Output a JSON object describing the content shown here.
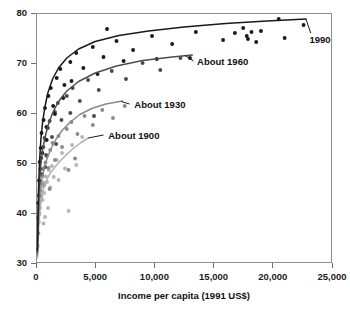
{
  "chart_data": {
    "type": "scatter",
    "title": "",
    "subtitle": "",
    "xlabel": "Income per capita (1991 US$)",
    "ylabel": "",
    "xlim": [
      0,
      25000
    ],
    "ylim": [
      30,
      80
    ],
    "grid": false,
    "legend_position": "inline-curve-labels",
    "xticks": [
      0,
      5000,
      10000,
      15000,
      20000,
      25000
    ],
    "xtick_labels": [
      "0",
      "5,000",
      "10,000",
      "15,000",
      "20,000",
      "25,000"
    ],
    "yticks": [
      30,
      40,
      50,
      60,
      70,
      80
    ],
    "ytick_labels": [
      "30",
      "40",
      "50",
      "60",
      "70",
      "80"
    ],
    "annotations": [
      {
        "text": "1990",
        "x": 23100,
        "y": 74.6,
        "color": "#111111"
      },
      {
        "text": "About 1960",
        "x": 13600,
        "y": 70.2,
        "color": "#111111"
      },
      {
        "text": "About 1930",
        "x": 8300,
        "y": 61.6,
        "color": "#111111"
      },
      {
        "text": "About 1900",
        "x": 6100,
        "y": 55.4,
        "color": "#111111"
      }
    ],
    "series": [
      {
        "name": "About 1900",
        "color": "#b6b6b6",
        "curve_color": "#b2b2b2",
        "curve": [
          [
            120,
            31.0
          ],
          [
            200,
            36.0
          ],
          [
            300,
            39.8
          ],
          [
            420,
            42.4
          ],
          [
            560,
            44.2
          ],
          [
            750,
            45.7
          ],
          [
            980,
            47.0
          ],
          [
            1250,
            48.1
          ],
          [
            1600,
            49.2
          ],
          [
            2000,
            50.3
          ],
          [
            2500,
            51.5
          ],
          [
            3100,
            52.8
          ],
          [
            3800,
            54.1
          ],
          [
            4400,
            55.0
          ]
        ],
        "points": [
          [
            160,
            33.4
          ],
          [
            210,
            35.9
          ],
          [
            250,
            38.2
          ],
          [
            300,
            40.0
          ],
          [
            340,
            41.0
          ],
          [
            380,
            43.2
          ],
          [
            430,
            44.4
          ],
          [
            480,
            45.3
          ],
          [
            560,
            42.6
          ],
          [
            620,
            46.1
          ],
          [
            700,
            44.0
          ],
          [
            820,
            47.3
          ],
          [
            930,
            46.2
          ],
          [
            1080,
            48.6
          ],
          [
            1200,
            45.1
          ],
          [
            1350,
            49.4
          ],
          [
            1500,
            47.2
          ],
          [
            1750,
            50.6
          ],
          [
            1900,
            46.6
          ],
          [
            2200,
            52.0
          ],
          [
            2450,
            48.9
          ],
          [
            2750,
            40.4
          ],
          [
            3050,
            53.6
          ],
          [
            3400,
            49.6
          ],
          [
            3900,
            55.2
          ],
          [
            1020,
            41.0
          ],
          [
            760,
            39.2
          ],
          [
            640,
            37.9
          ]
        ]
      },
      {
        "name": "About 1930",
        "color": "#8c8c8c",
        "curve_color": "#8a8a8a",
        "curve": [
          [
            120,
            31.5
          ],
          [
            200,
            38.0
          ],
          [
            300,
            42.6
          ],
          [
            420,
            45.6
          ],
          [
            560,
            47.6
          ],
          [
            750,
            49.5
          ],
          [
            980,
            51.2
          ],
          [
            1300,
            53.0
          ],
          [
            1700,
            54.8
          ],
          [
            2200,
            56.5
          ],
          [
            2900,
            58.2
          ],
          [
            3700,
            59.7
          ],
          [
            4700,
            60.9
          ],
          [
            5900,
            61.8
          ],
          [
            7300,
            62.4
          ]
        ],
        "points": [
          [
            180,
            36.0
          ],
          [
            240,
            39.7
          ],
          [
            290,
            42.1
          ],
          [
            350,
            44.4
          ],
          [
            400,
            46.0
          ],
          [
            460,
            43.4
          ],
          [
            530,
            47.4
          ],
          [
            610,
            48.8
          ],
          [
            700,
            45.6
          ],
          [
            800,
            50.1
          ],
          [
            900,
            51.4
          ],
          [
            1050,
            49.0
          ],
          [
            1200,
            52.6
          ],
          [
            1400,
            54.0
          ],
          [
            1600,
            50.6
          ],
          [
            1900,
            55.4
          ],
          [
            2200,
            53.2
          ],
          [
            2600,
            56.8
          ],
          [
            3000,
            58.2
          ],
          [
            3500,
            55.8
          ],
          [
            4100,
            59.4
          ],
          [
            4800,
            57.6
          ],
          [
            5600,
            60.6
          ],
          [
            6500,
            59.0
          ],
          [
            7500,
            61.4
          ],
          [
            2750,
            48.6
          ],
          [
            1150,
            44.8
          ],
          [
            3300,
            50.9
          ]
        ]
      },
      {
        "name": "About 1960",
        "color": "#4a4a4a",
        "curve_color": "#4d4d4d",
        "curve": [
          [
            120,
            32.0
          ],
          [
            200,
            41.0
          ],
          [
            300,
            46.4
          ],
          [
            420,
            50.0
          ],
          [
            560,
            52.6
          ],
          [
            750,
            55.0
          ],
          [
            1000,
            57.4
          ],
          [
            1400,
            60.0
          ],
          [
            1900,
            62.3
          ],
          [
            2600,
            64.4
          ],
          [
            3600,
            66.3
          ],
          [
            5000,
            68.0
          ],
          [
            6800,
            69.4
          ],
          [
            9000,
            70.5
          ],
          [
            11500,
            71.2
          ],
          [
            13200,
            71.6
          ]
        ],
        "points": [
          [
            190,
            39.0
          ],
          [
            250,
            43.5
          ],
          [
            310,
            46.0
          ],
          [
            380,
            48.8
          ],
          [
            450,
            51.0
          ],
          [
            520,
            47.8
          ],
          [
            620,
            53.2
          ],
          [
            720,
            55.0
          ],
          [
            850,
            51.6
          ],
          [
            1000,
            57.0
          ],
          [
            1150,
            58.4
          ],
          [
            1350,
            55.2
          ],
          [
            1600,
            60.2
          ],
          [
            1850,
            62.0
          ],
          [
            2150,
            58.6
          ],
          [
            2600,
            63.4
          ],
          [
            3100,
            65.0
          ],
          [
            3700,
            62.4
          ],
          [
            4400,
            66.6
          ],
          [
            5300,
            64.6
          ],
          [
            6400,
            68.4
          ],
          [
            7600,
            66.8
          ],
          [
            9000,
            70.0
          ],
          [
            10500,
            68.6
          ],
          [
            12200,
            71.0
          ],
          [
            1700,
            53.8
          ],
          [
            2900,
            60.0
          ],
          [
            4900,
            59.4
          ],
          [
            780,
            49.2
          ]
        ]
      },
      {
        "name": "1990",
        "color": "#1a1a1a",
        "curve_color": "#1a1a1a",
        "curve": [
          [
            120,
            32.5
          ],
          [
            200,
            44.0
          ],
          [
            300,
            50.4
          ],
          [
            420,
            55.0
          ],
          [
            560,
            58.2
          ],
          [
            750,
            61.2
          ],
          [
            1000,
            64.0
          ],
          [
            1400,
            66.8
          ],
          [
            1900,
            69.0
          ],
          [
            2600,
            71.0
          ],
          [
            3600,
            72.8
          ],
          [
            5000,
            74.3
          ],
          [
            7000,
            75.5
          ],
          [
            9500,
            76.4
          ],
          [
            12500,
            77.2
          ],
          [
            16000,
            77.9
          ],
          [
            19500,
            78.4
          ],
          [
            22800,
            78.8
          ]
        ],
        "points": [
          [
            200,
            42.0
          ],
          [
            260,
            46.5
          ],
          [
            320,
            50.2
          ],
          [
            400,
            53.0
          ],
          [
            470,
            56.0
          ],
          [
            540,
            52.0
          ],
          [
            640,
            58.6
          ],
          [
            760,
            61.0
          ],
          [
            880,
            57.2
          ],
          [
            1050,
            63.4
          ],
          [
            1250,
            65.0
          ],
          [
            1450,
            61.4
          ],
          [
            1750,
            67.0
          ],
          [
            2050,
            68.8
          ],
          [
            2400,
            65.6
          ],
          [
            2900,
            70.2
          ],
          [
            3400,
            72.0
          ],
          [
            4000,
            69.0
          ],
          [
            4800,
            73.2
          ],
          [
            5700,
            71.2
          ],
          [
            6800,
            74.4
          ],
          [
            8200,
            72.6
          ],
          [
            9800,
            75.4
          ],
          [
            11500,
            73.8
          ],
          [
            13500,
            76.2
          ],
          [
            15800,
            74.6
          ],
          [
            17500,
            77.0
          ],
          [
            18200,
            76.2
          ],
          [
            17800,
            75.4
          ],
          [
            19000,
            76.4
          ],
          [
            20500,
            78.8
          ],
          [
            22600,
            77.6
          ],
          [
            21000,
            75.0
          ],
          [
            6000,
            76.8
          ],
          [
            10200,
            70.8
          ],
          [
            3000,
            66.4
          ],
          [
            1600,
            59.8
          ],
          [
            900,
            54.6
          ],
          [
            13000,
            71.0
          ],
          [
            7400,
            70.4
          ],
          [
            17900,
            74.8
          ],
          [
            18600,
            74.2
          ],
          [
            16800,
            76.0
          ],
          [
            5200,
            67.8
          ],
          [
            2300,
            63.0
          ]
        ]
      }
    ]
  }
}
